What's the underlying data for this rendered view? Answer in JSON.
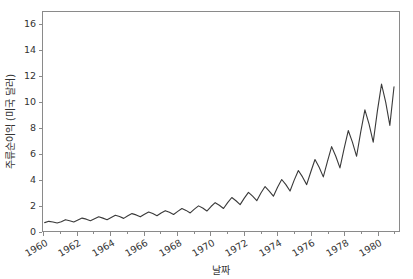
{
  "chart_data": {
    "type": "line",
    "title": "",
    "xlabel": "날짜",
    "ylabel": "주류순이익 (미국 달러)",
    "xlim": [
      1959.9,
      1981.3
    ],
    "ylim": [
      0,
      17.0
    ],
    "grid": false,
    "legend": null,
    "line_color": "#3a3a3a",
    "line_width": 1.1,
    "frame_color": "#8a8a8a",
    "tick_label_color": "#333333",
    "x_tick_labels": [
      "1960",
      "1962",
      "1964",
      "1966",
      "1968",
      "1970",
      "1972",
      "1974",
      "1976",
      "1978",
      "1980"
    ],
    "x_tick_values": [
      1960,
      1962,
      1964,
      1966,
      1968,
      1970,
      1972,
      1974,
      1976,
      1978,
      1980
    ],
    "x_minor_tick_values": [
      1961,
      1963,
      1965,
      1967,
      1969,
      1971,
      1973,
      1975,
      1977,
      1979,
      1981
    ],
    "y_tick_labels": [
      "0",
      "2",
      "4",
      "6",
      "8",
      "10",
      "12",
      "14",
      "16"
    ],
    "y_tick_values": [
      0,
      2,
      4,
      6,
      8,
      10,
      12,
      14,
      16
    ],
    "x": [
      1960.0,
      1960.25,
      1960.5,
      1960.75,
      1961.0,
      1961.25,
      1961.5,
      1961.75,
      1962.0,
      1962.25,
      1962.5,
      1962.75,
      1963.0,
      1963.25,
      1963.5,
      1963.75,
      1964.0,
      1964.25,
      1964.5,
      1964.75,
      1965.0,
      1965.25,
      1965.5,
      1965.75,
      1966.0,
      1966.25,
      1966.5,
      1966.75,
      1967.0,
      1967.25,
      1967.5,
      1967.75,
      1968.0,
      1968.25,
      1968.5,
      1968.75,
      1969.0,
      1969.25,
      1969.5,
      1969.75,
      1970.0,
      1970.25,
      1970.5,
      1970.75,
      1971.0,
      1971.25,
      1971.5,
      1971.75,
      1972.0,
      1972.25,
      1972.5,
      1972.75,
      1973.0,
      1973.25,
      1973.5,
      1973.75,
      1974.0,
      1974.25,
      1974.5,
      1974.75,
      1975.0,
      1975.25,
      1975.5,
      1975.75,
      1976.0,
      1976.25,
      1976.5,
      1976.75,
      1977.0,
      1977.25,
      1977.5,
      1977.75,
      1978.0,
      1978.25,
      1978.5,
      1978.75,
      1979.0,
      1979.25,
      1979.5,
      1979.75,
      1980.0,
      1980.25,
      1980.5,
      1980.75,
      1981.0
    ],
    "y": [
      0.65,
      0.75,
      0.7,
      0.62,
      0.72,
      0.88,
      0.8,
      0.7,
      0.85,
      1.0,
      0.92,
      0.8,
      0.95,
      1.1,
      1.0,
      0.88,
      1.05,
      1.22,
      1.12,
      0.98,
      1.18,
      1.35,
      1.25,
      1.1,
      1.3,
      1.48,
      1.35,
      1.18,
      1.4,
      1.58,
      1.45,
      1.28,
      1.52,
      1.75,
      1.6,
      1.4,
      1.7,
      1.95,
      1.78,
      1.55,
      1.9,
      2.2,
      2.0,
      1.75,
      2.2,
      2.6,
      2.35,
      2.05,
      2.55,
      3.0,
      2.7,
      2.35,
      2.95,
      3.45,
      3.1,
      2.7,
      3.4,
      4.0,
      3.6,
      3.1,
      3.95,
      4.7,
      4.2,
      3.6,
      4.6,
      5.55,
      4.95,
      4.2,
      5.4,
      6.55,
      5.8,
      4.9,
      6.4,
      7.8,
      6.9,
      5.8,
      7.7,
      9.4,
      8.3,
      6.9,
      9.3,
      11.4,
      10.0,
      8.2,
      11.2,
      13.8,
      12.0,
      9.7,
      13.5,
      16.0,
      14.6,
      11.5
    ]
  }
}
